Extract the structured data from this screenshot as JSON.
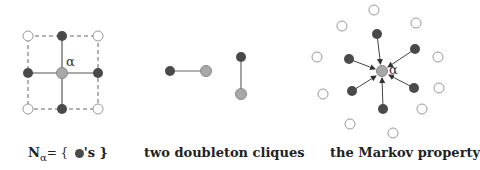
{
  "colors": {
    "dark": "#4a4a4a",
    "gray": "#a8a8a8",
    "open_fill": "#ffffff",
    "open_stroke": "#9a9a9a",
    "edge": "#666666"
  },
  "panels": [
    {
      "label_prefix": "N",
      "label_sub": "α",
      "label_eq": "= {",
      "label_suffix": "'s }",
      "alpha": "α"
    },
    {
      "label": "two doubleton cliques"
    },
    {
      "label": "the Markov property",
      "alpha": "α"
    }
  ]
}
